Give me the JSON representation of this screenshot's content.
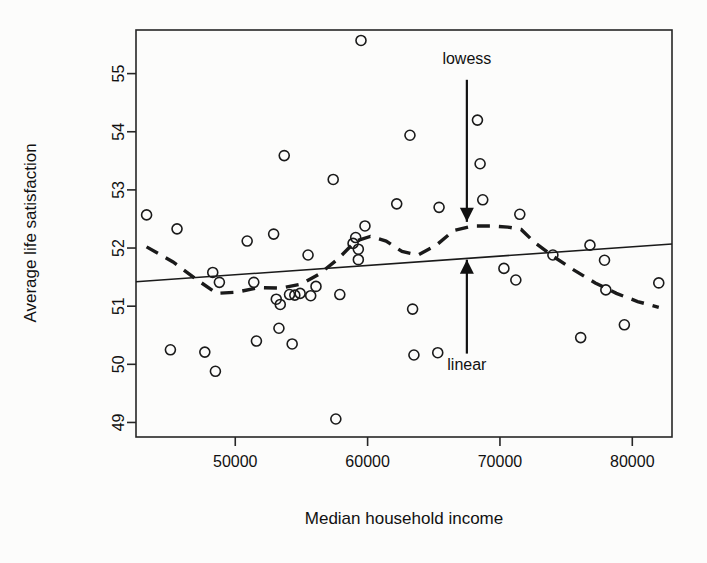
{
  "chart_data": {
    "type": "scatter",
    "title": "",
    "xlabel": "Median household income",
    "ylabel": "Average life satisfaction",
    "xlim": [
      42500,
      83000
    ],
    "ylim": [
      48.75,
      55.75
    ],
    "xticks": [
      50000,
      60000,
      70000,
      80000
    ],
    "xtick_labels": [
      "50000",
      "60000",
      "70000",
      "80000"
    ],
    "yticks": [
      49,
      50,
      51,
      52,
      53,
      54,
      55
    ],
    "ytick_labels": [
      "49",
      "50",
      "51",
      "52",
      "53",
      "54",
      "55"
    ],
    "grid": false,
    "legend": "none",
    "annotations": [
      {
        "label": "lowess",
        "x": 67500,
        "y": 55.1,
        "arrow_to_y": 52.45,
        "direction": "down"
      },
      {
        "label": "linear",
        "x": 67500,
        "y": 50.15,
        "arrow_to_y": 51.8,
        "direction": "up"
      }
    ],
    "points": [
      {
        "x": 43300,
        "y": 52.57
      },
      {
        "x": 45100,
        "y": 50.25
      },
      {
        "x": 45600,
        "y": 52.33
      },
      {
        "x": 47700,
        "y": 50.21
      },
      {
        "x": 48300,
        "y": 51.58
      },
      {
        "x": 48500,
        "y": 49.88
      },
      {
        "x": 48800,
        "y": 51.41
      },
      {
        "x": 50900,
        "y": 52.12
      },
      {
        "x": 51400,
        "y": 51.41
      },
      {
        "x": 51600,
        "y": 50.4
      },
      {
        "x": 52900,
        "y": 52.24
      },
      {
        "x": 53100,
        "y": 51.12
      },
      {
        "x": 53300,
        "y": 50.62
      },
      {
        "x": 53400,
        "y": 51.03
      },
      {
        "x": 53700,
        "y": 53.59
      },
      {
        "x": 54100,
        "y": 51.2
      },
      {
        "x": 54300,
        "y": 50.35
      },
      {
        "x": 54500,
        "y": 51.19
      },
      {
        "x": 54900,
        "y": 51.22
      },
      {
        "x": 55500,
        "y": 51.88
      },
      {
        "x": 55700,
        "y": 51.18
      },
      {
        "x": 56100,
        "y": 51.34
      },
      {
        "x": 57400,
        "y": 53.18
      },
      {
        "x": 57600,
        "y": 49.06
      },
      {
        "x": 57900,
        "y": 51.2
      },
      {
        "x": 58900,
        "y": 52.08
      },
      {
        "x": 59100,
        "y": 52.18
      },
      {
        "x": 59300,
        "y": 51.98
      },
      {
        "x": 59300,
        "y": 51.8
      },
      {
        "x": 59500,
        "y": 55.57
      },
      {
        "x": 59800,
        "y": 52.38
      },
      {
        "x": 62200,
        "y": 52.76
      },
      {
        "x": 63200,
        "y": 53.94
      },
      {
        "x": 63400,
        "y": 50.95
      },
      {
        "x": 63500,
        "y": 50.16
      },
      {
        "x": 65300,
        "y": 50.2
      },
      {
        "x": 65400,
        "y": 52.7
      },
      {
        "x": 68300,
        "y": 54.2
      },
      {
        "x": 68500,
        "y": 53.45
      },
      {
        "x": 68700,
        "y": 52.83
      },
      {
        "x": 70300,
        "y": 51.65
      },
      {
        "x": 71200,
        "y": 51.45
      },
      {
        "x": 71500,
        "y": 52.58
      },
      {
        "x": 74000,
        "y": 51.88
      },
      {
        "x": 76100,
        "y": 50.46
      },
      {
        "x": 76800,
        "y": 52.05
      },
      {
        "x": 77900,
        "y": 51.79
      },
      {
        "x": 78000,
        "y": 51.28
      },
      {
        "x": 79400,
        "y": 50.68
      },
      {
        "x": 82000,
        "y": 51.4
      }
    ],
    "linear_fit": {
      "name": "linear",
      "style": "solid",
      "x": [
        42500,
        83000
      ],
      "y": [
        51.42,
        52.07
      ]
    },
    "lowess_fit": {
      "name": "lowess",
      "style": "dashed",
      "x": [
        43300,
        45300,
        47200,
        48600,
        50100,
        51800,
        53400,
        55000,
        56400,
        57800,
        59100,
        60200,
        61400,
        62600,
        63800,
        65200,
        66500,
        68000,
        69400,
        70600,
        71600,
        72600,
        74000,
        75600,
        77200,
        78800,
        80400,
        82000
      ],
      "y": [
        52.02,
        51.76,
        51.44,
        51.22,
        51.24,
        51.32,
        51.31,
        51.38,
        51.56,
        51.82,
        52.12,
        52.2,
        52.12,
        51.94,
        51.88,
        52.05,
        52.3,
        52.38,
        52.38,
        52.36,
        52.32,
        52.1,
        51.86,
        51.62,
        51.4,
        51.22,
        51.08,
        50.98
      ]
    }
  },
  "figure": {
    "background_color": "#fcfcfb",
    "point_color": "#1a1a1a",
    "line_color": "#1a1a1a",
    "axis_color": "#262626"
  }
}
